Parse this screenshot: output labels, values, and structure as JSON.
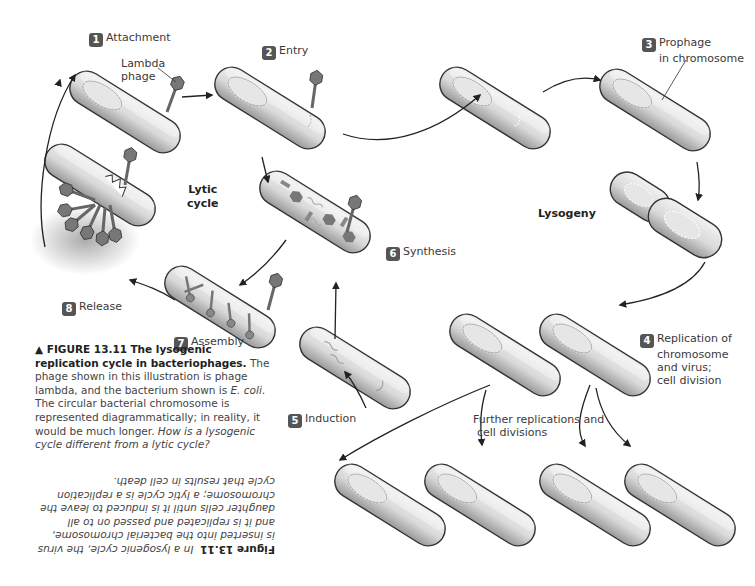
{
  "diagram": {
    "title": "The lysogenic replication cycle in bacteriophages",
    "badge_color": "#555555",
    "steps": [
      {
        "num": "1",
        "label": "Attachment"
      },
      {
        "num": "2",
        "label": "Entry"
      },
      {
        "num": "3",
        "label": "Prophage in chromosome",
        "lines": [
          "Prophage",
          "in chromosome"
        ]
      },
      {
        "num": "4",
        "label": "Replication of chromosome and virus; cell division",
        "lines": [
          "Replication of",
          "chromosome",
          "and virus;",
          "cell division"
        ]
      },
      {
        "num": "5",
        "label": "Induction"
      },
      {
        "num": "6",
        "label": "Synthesis"
      },
      {
        "num": "7",
        "label": "Assembly"
      },
      {
        "num": "8",
        "label": "Release"
      }
    ],
    "annotations": {
      "lambda_phage": [
        "Lambda",
        "phage"
      ],
      "further": [
        "Further replications and",
        "cell divisions"
      ]
    },
    "cycle_labels": {
      "lytic": [
        "Lytic",
        "cycle"
      ],
      "lysogeny": "Lysogeny"
    }
  },
  "caption": {
    "figure_label": "▲ FIGURE 13.11",
    "figure_title": "The lysogenic replication cycle in bacteriophages.",
    "text1": " The phage shown in this illustration is phage lambda, and the bacterium shown is ",
    "species": "E. coli",
    "text2": ". The circular bacterial chromosome is represented diagrammatically; in reality, it would be much longer. ",
    "question": "How is a lysogenic cycle different from a lytic cycle?"
  },
  "answer": {
    "label": "Figure 13.11",
    "text": "In a lysogenic cycle, the virus is inserted into the bacterial chromosome, and it is replicated and passed on to all daughter cells until it is induced to leave the chromosome; a lytic cycle is a replication cycle that results in cell death."
  }
}
